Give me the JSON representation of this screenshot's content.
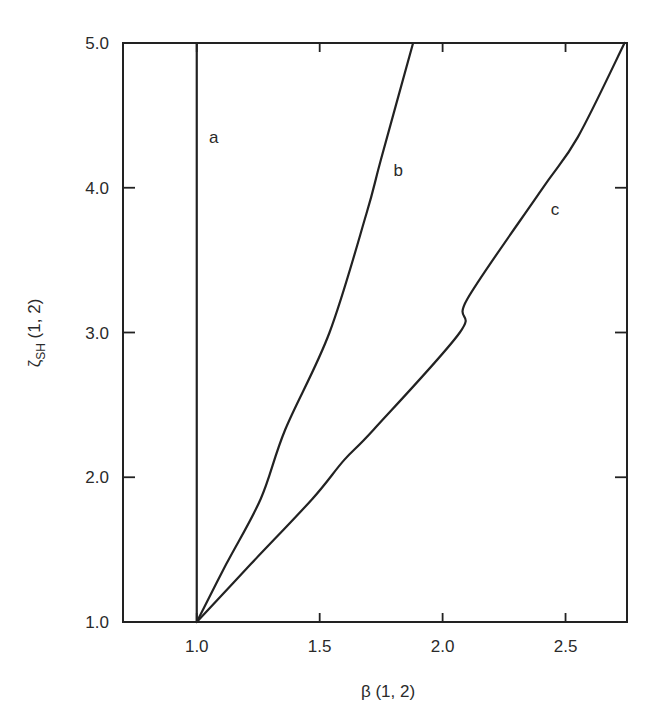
{
  "chart_data": {
    "type": "line",
    "title": "",
    "xlabel": "β (1, 2)",
    "ylabel_main": "ζ",
    "ylabel_sub": "SH",
    "ylabel_suffix": " (1, 2)",
    "ylabel": "ζ_SH (1, 2)",
    "xlim": [
      0.7,
      2.75
    ],
    "ylim": [
      1.0,
      5.0
    ],
    "x_ticks": [
      1.0,
      1.5,
      2.0,
      2.5
    ],
    "x_tick_labels": [
      "1.0",
      "1.5",
      "2.0",
      "2.5"
    ],
    "y_ticks": [
      1.0,
      2.0,
      3.0,
      4.0,
      5.0
    ],
    "y_tick_labels": [
      "1.0",
      "2.0",
      "3.0",
      "4.0",
      "5.0"
    ],
    "grid": false,
    "legend": "none (curves labeled inline)",
    "series": [
      {
        "name": "a",
        "x": [
          1.0,
          1.0
        ],
        "y": [
          1.0,
          5.0
        ],
        "label_pos": [
          1.05,
          4.35
        ]
      },
      {
        "name": "b",
        "x": [
          1.0,
          1.12,
          1.26,
          1.36,
          1.54,
          1.69,
          1.75,
          1.88
        ],
        "y": [
          1.0,
          1.4,
          1.85,
          2.33,
          3.0,
          3.82,
          4.2,
          5.0
        ],
        "label_pos": [
          1.8,
          4.12
        ]
      },
      {
        "name": "c",
        "x": [
          1.0,
          1.22,
          1.47,
          1.6,
          1.72,
          2.07,
          2.1,
          2.4,
          2.55,
          2.74
        ],
        "y": [
          1.0,
          1.4,
          1.85,
          2.12,
          2.33,
          3.0,
          3.23,
          3.98,
          4.35,
          5.0
        ],
        "label_pos": [
          2.44,
          3.85
        ]
      }
    ]
  },
  "labels": {
    "x_axis_title": "β (1, 2)",
    "y_axis_main": "ζ",
    "y_axis_sub": "SH",
    "y_axis_suffix": " (1, 2)"
  }
}
